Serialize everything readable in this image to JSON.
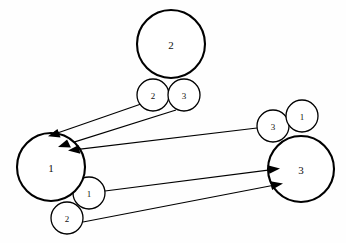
{
  "diagram": {
    "background_color": "#fefefe",
    "stroke_color": "#000000",
    "node_fill": "#ffffff",
    "big_nodes": [
      {
        "id": "top",
        "label": "2",
        "cx": 171,
        "cy": 44,
        "r": 34
      },
      {
        "id": "left",
        "label": "1",
        "cx": 51,
        "cy": 167,
        "r": 34
      },
      {
        "id": "right",
        "label": "3",
        "cx": 301,
        "cy": 169,
        "r": 33
      }
    ],
    "small_nodes": [
      {
        "id": "top-port-2",
        "label": "2",
        "cx": 153,
        "cy": 95,
        "r": 16
      },
      {
        "id": "top-port-3",
        "label": "3",
        "cx": 184,
        "cy": 95,
        "r": 16
      },
      {
        "id": "left-port-1",
        "label": "1",
        "cx": 89,
        "cy": 193,
        "r": 16
      },
      {
        "id": "left-port-2",
        "label": "2",
        "cx": 67,
        "cy": 218,
        "r": 16
      },
      {
        "id": "right-port-3",
        "label": "3",
        "cx": 273,
        "cy": 126,
        "r": 16
      },
      {
        "id": "right-port-1",
        "label": "1",
        "cx": 302,
        "cy": 116,
        "r": 16
      }
    ],
    "edges": [
      {
        "id": "edge-top2-to-left",
        "from": "top-port-2",
        "to": "left",
        "x1": 141,
        "y1": 104,
        "x2": 54,
        "y2": 134,
        "arrow": true
      },
      {
        "id": "edge-top3-to-left",
        "from": "top-port-3",
        "to": "left",
        "x1": 176,
        "y1": 110,
        "x2": 64,
        "y2": 145,
        "arrow": true
      },
      {
        "id": "edge-right3-to-left",
        "from": "right-port-3",
        "to": "left",
        "x1": 257,
        "y1": 128,
        "x2": 73,
        "y2": 150,
        "arrow": true
      },
      {
        "id": "edge-left1-to-right",
        "from": "left-port-1",
        "to": "right",
        "x1": 105,
        "y1": 191,
        "x2": 277,
        "y2": 169,
        "arrow": true
      },
      {
        "id": "edge-left2-to-right",
        "from": "left-port-2",
        "to": "right",
        "x1": 83,
        "y1": 222,
        "x2": 280,
        "y2": 184,
        "arrow": true
      }
    ]
  }
}
